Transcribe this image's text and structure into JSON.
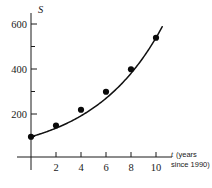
{
  "chart_data": {
    "type": "scatter",
    "title": "",
    "subtitle": "",
    "xlabel": "t (years since 1990)",
    "xlabel_variable": "t",
    "xlabel_line1": "(years",
    "xlabel_line2": "since 1990)",
    "ylabel": "S",
    "x": [
      0,
      2,
      4,
      6,
      8,
      10
    ],
    "values": [
      90,
      140,
      210,
      290,
      390,
      530
    ],
    "series": [
      {
        "name": "data points",
        "x": [
          0,
          2,
          4,
          6,
          8,
          10
        ],
        "values": [
          90,
          140,
          210,
          290,
          390,
          530
        ]
      },
      {
        "name": "fitted exponential curve",
        "model": "S = 90 e^(0.185 t)",
        "x_range": [
          0,
          10.5
        ]
      }
    ],
    "xlim": [
      0,
      11.2
    ],
    "ylim": [
      0,
      660
    ],
    "xticks": [
      2,
      4,
      6,
      8,
      10
    ],
    "xtick_labels": [
      "2",
      "4",
      "6",
      "8",
      "10"
    ],
    "yticks": [
      200,
      400,
      600
    ],
    "ytick_labels": [
      "200",
      "400",
      "600"
    ],
    "yticks_minor": [
      100,
      300,
      500
    ],
    "grid": false,
    "legend": "none",
    "colors": {
      "axis": "#1a1a1a",
      "curve": "#111111",
      "point": "#0a0a0a",
      "background": "#ffffff"
    }
  }
}
